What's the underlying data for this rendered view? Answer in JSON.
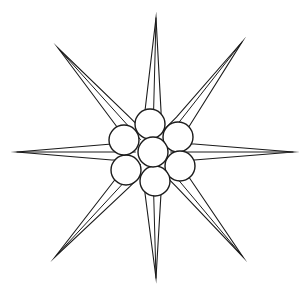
{
  "figure": {
    "kind": "line-drawing",
    "background_color": "#ffffff",
    "stroke_color": "#1b1b1b",
    "canvas": {
      "width": 307,
      "height": 295
    },
    "center": {
      "x": 153,
      "y": 152
    }
  },
  "star": {
    "name": "eight-pointed-star",
    "point_count": 8,
    "inner_radius": 42,
    "notch_half_width": 9,
    "tips": [
      {
        "label": "north",
        "x": 156,
        "y": 18,
        "angle_deg": 90
      },
      {
        "label": "northeast",
        "x": 242,
        "y": 42,
        "angle_deg": 45
      },
      {
        "label": "east",
        "x": 293,
        "y": 152,
        "angle_deg": 0
      },
      {
        "label": "southeast",
        "x": 243,
        "y": 257,
        "angle_deg": 315
      },
      {
        "label": "south",
        "x": 156,
        "y": 278,
        "angle_deg": 270
      },
      {
        "label": "southwest",
        "x": 55,
        "y": 257,
        "angle_deg": 225
      },
      {
        "label": "west",
        "x": 17,
        "y": 152,
        "angle_deg": 180
      },
      {
        "label": "northwest",
        "x": 58,
        "y": 48,
        "angle_deg": 135
      }
    ]
  },
  "circle_cluster": {
    "name": "seven-circle-hexagonal-cluster",
    "circle_count": 7,
    "radius": 15,
    "circles": [
      {
        "label": "center",
        "x": 153,
        "y": 152
      },
      {
        "label": "upper",
        "x": 150,
        "y": 124
      },
      {
        "label": "upper-right",
        "x": 178,
        "y": 137
      },
      {
        "label": "lower-right",
        "x": 180,
        "y": 166
      },
      {
        "label": "lower",
        "x": 155,
        "y": 181
      },
      {
        "label": "lower-left",
        "x": 126,
        "y": 170
      },
      {
        "label": "upper-left",
        "x": 124,
        "y": 140
      }
    ]
  },
  "rays": {
    "name": "internal-ray-lines",
    "description": "thin lines from cluster edge to each star tip",
    "count": 8
  }
}
